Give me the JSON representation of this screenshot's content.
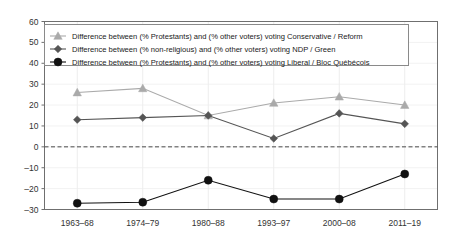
{
  "chart_data": {
    "type": "line",
    "title": "",
    "xlabel": "",
    "ylabel": "",
    "categories": [
      "1963–68",
      "1974–79",
      "1980–88",
      "1993–97",
      "2000–08",
      "2011–19"
    ],
    "ylim": [
      -30,
      60
    ],
    "yticks": [
      -30,
      -20,
      -10,
      0,
      10,
      20,
      30,
      40,
      50,
      60
    ],
    "ytick_labels": [
      "–30",
      "–20",
      "–10",
      "0",
      "10",
      "20",
      "30",
      "40",
      "50",
      "60"
    ],
    "grid": true,
    "zero_reference_line": 0,
    "legend_position": "upper-left-inside",
    "series": [
      {
        "name": "Difference between (% Protestants) and (% other voters) voting Conservative / Reform",
        "marker": "triangle",
        "color": "#aaaaaa",
        "values": [
          26,
          28,
          15,
          21,
          24,
          20
        ]
      },
      {
        "name": "Difference between (% non-religious) and (% other voters) voting NDP / Green",
        "marker": "diamond",
        "color": "#555555",
        "values": [
          13,
          14,
          15,
          4,
          16,
          11
        ]
      },
      {
        "name": "Difference between (% Protestants) and (% other voters) voting Liberal / Bloc Québécois",
        "marker": "circle",
        "color": "#111111",
        "values": [
          -27,
          -26.5,
          -16,
          -25,
          -25,
          -13
        ]
      }
    ]
  },
  "colors": {
    "series_conservative": "#aaaaaa",
    "series_ndp": "#555555",
    "series_liberal": "#111111",
    "axis": "#6f6f6f",
    "grid": "#ededed",
    "zero_line": "#4a4a4a",
    "background": "#ffffff"
  }
}
